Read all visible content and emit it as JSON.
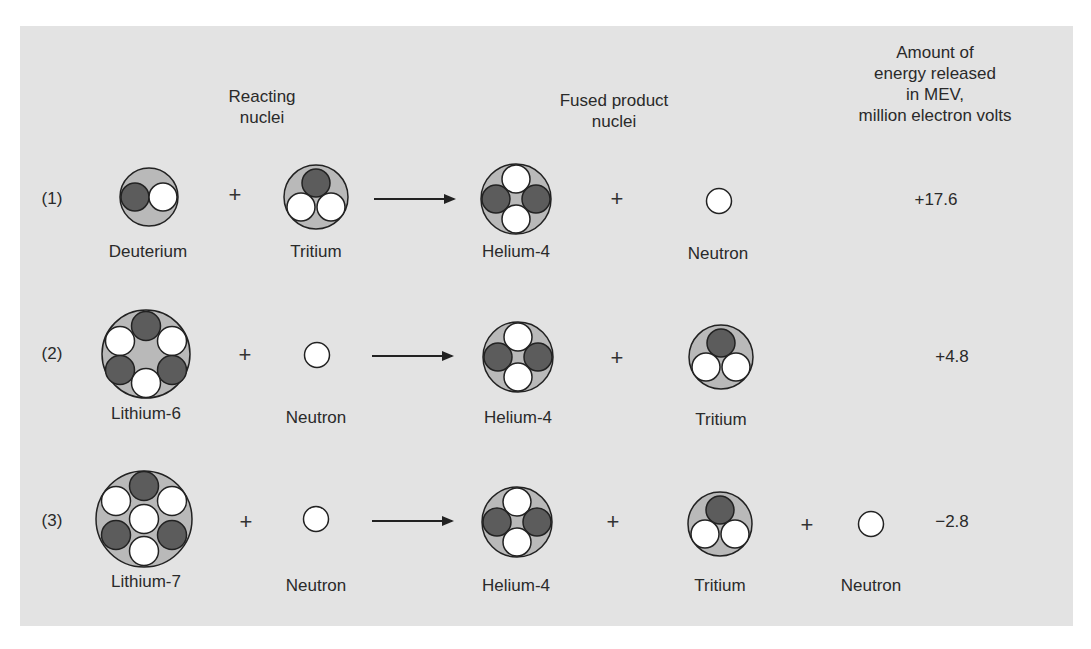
{
  "headers": {
    "reacting": [
      "Reacting",
      "nuclei"
    ],
    "fused": [
      "Fused product",
      "nuclei"
    ],
    "energy": [
      "Amount of",
      "energy released",
      "in MEV,",
      "million electron volts"
    ]
  },
  "colors": {
    "background": "#e3e3e3",
    "nucleus_shell": "#b9b9b9",
    "proton": "#5c5c5c",
    "neutron": "#ffffff",
    "outline": "#222222"
  },
  "reactions": [
    {
      "label": "(1)",
      "reactants": [
        "Deuterium",
        "Tritium"
      ],
      "products": [
        "Helium-4",
        "Neutron"
      ],
      "energy": "+17.6"
    },
    {
      "label": "(2)",
      "reactants": [
        "Lithium-6",
        "Neutron"
      ],
      "products": [
        "Helium-4",
        "Tritium"
      ],
      "energy": "+4.8"
    },
    {
      "label": "(3)",
      "reactants": [
        "Lithium-7",
        "Neutron"
      ],
      "products": [
        "Helium-4",
        "Tritium",
        "Neutron"
      ],
      "energy": "−2.8"
    }
  ],
  "operators": {
    "plus": "+"
  }
}
